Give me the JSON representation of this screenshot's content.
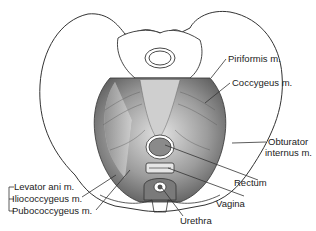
{
  "diagram": {
    "labels": {
      "piriformis": "Piriformis m.",
      "coccygeus": "Coccygeus m.",
      "obturator_internus_line1": "Obturator",
      "obturator_internus_line2": "internus m.",
      "rectum": "Rectum",
      "vagina": "Vagina",
      "urethra": "Urethra",
      "levator_ani": "Levator ani m.",
      "iliococcygeus": "Iliococcygeus m.",
      "pubococcygeus": "Pubococcygeus m."
    },
    "colors": {
      "line": "#333333",
      "bone": "#ffffff",
      "muscle_dark": "#6e6e6e",
      "muscle_light": "#d6d6d6",
      "organ": "#9a9a9a"
    }
  }
}
